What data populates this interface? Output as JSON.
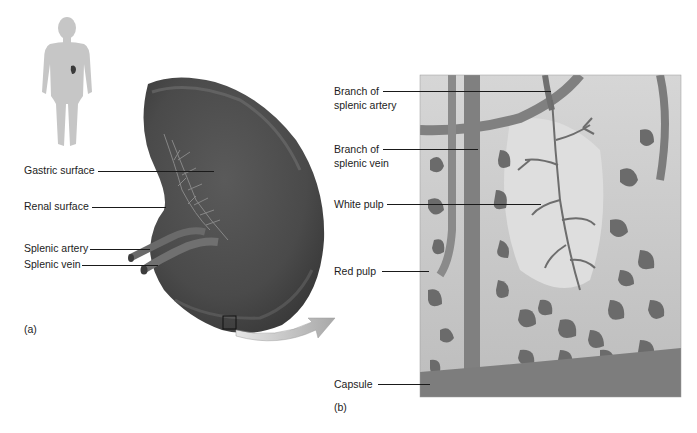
{
  "figure": {
    "panels": [
      {
        "id": "a",
        "letter": "(a)",
        "description": "Gross anatomy of the spleen with body locator figure",
        "labels": [
          {
            "text": "Gastric surface"
          },
          {
            "text": "Renal surface"
          },
          {
            "text": "Splenic artery"
          },
          {
            "text": "Splenic vein"
          }
        ]
      },
      {
        "id": "b",
        "letter": "(b)",
        "description": "Magnified section of splenic tissue",
        "labels": [
          {
            "line1": "Branch of",
            "line2": "splenic artery"
          },
          {
            "line1": "Branch of",
            "line2": "splenic vein"
          },
          {
            "text": "White pulp"
          },
          {
            "text": "Red pulp"
          },
          {
            "text": "Capsule"
          }
        ]
      }
    ],
    "colors": {
      "spleen": "#4d4d4d",
      "spleen_highlight": "#6a6a6a",
      "vessels": "#6e6e6e",
      "tissue_bg": "#c9c9c9",
      "white_pulp": "#dcdcdc",
      "red_pulp_sinus": "#6a6a6a",
      "capsule": "#7a7a7a",
      "body_figure": "#c4c4c4",
      "arrow": "#bdbdbd"
    }
  }
}
